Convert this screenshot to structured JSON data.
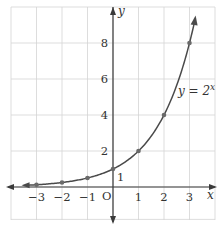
{
  "chart_data": {
    "type": "line",
    "title": "",
    "xlabel": "x",
    "ylabel": "y",
    "origin_label": "O",
    "curve_label": "y = 2^x",
    "curve_label_base": "y = 2",
    "curve_label_exp": "x",
    "series": [
      {
        "name": "y = 2^x",
        "function": "2^x",
        "x": [
          -3,
          -2,
          -1,
          0,
          1,
          2,
          3
        ],
        "values": [
          0.125,
          0.25,
          0.5,
          1,
          2,
          4,
          8
        ]
      }
    ],
    "x_ticks": [
      -3,
      -2,
      -1,
      1,
      2,
      3
    ],
    "x_tick_labels": [
      "−3",
      "−2",
      "−1",
      "1",
      "2",
      "3"
    ],
    "y_ticks": [
      2,
      4,
      6,
      8
    ],
    "y_tick_labels": [
      "2",
      "4",
      "6",
      "8"
    ],
    "y_intercept_label": "1",
    "xlim": [
      -4,
      4
    ],
    "ylim": [
      -1.8,
      10
    ],
    "grid": true,
    "legend": "none",
    "colors": {
      "curve": "#4a4a4a",
      "grid": "#d4d4d4",
      "axis": "#3a3a3a"
    }
  }
}
